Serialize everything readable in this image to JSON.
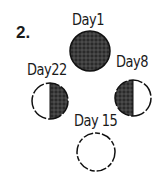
{
  "question_number": "2.",
  "phases": [
    {
      "label": "Day1",
      "shading": "full-dark"
    },
    {
      "label": "Day8",
      "shading": "left-dark"
    },
    {
      "label": "Day 15",
      "shading": "none"
    },
    {
      "label": "Day22",
      "shading": "right-dark"
    }
  ],
  "colors": {
    "ink": "#1a1a1a",
    "paper": "#ffffff"
  }
}
